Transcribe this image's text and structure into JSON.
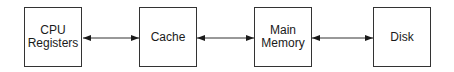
{
  "diagram": {
    "type": "memory-hierarchy",
    "nodes": [
      {
        "id": "cpu",
        "lines": [
          "CPU",
          "Registers"
        ]
      },
      {
        "id": "cache",
        "lines": [
          "Cache"
        ]
      },
      {
        "id": "memory",
        "lines": [
          "Main",
          "Memory"
        ]
      },
      {
        "id": "disk",
        "lines": [
          "Disk"
        ]
      }
    ],
    "edges": [
      {
        "from": "cpu",
        "to": "cache",
        "direction": "bidirectional"
      },
      {
        "from": "cache",
        "to": "memory",
        "direction": "bidirectional"
      },
      {
        "from": "memory",
        "to": "disk",
        "direction": "bidirectional"
      }
    ]
  }
}
